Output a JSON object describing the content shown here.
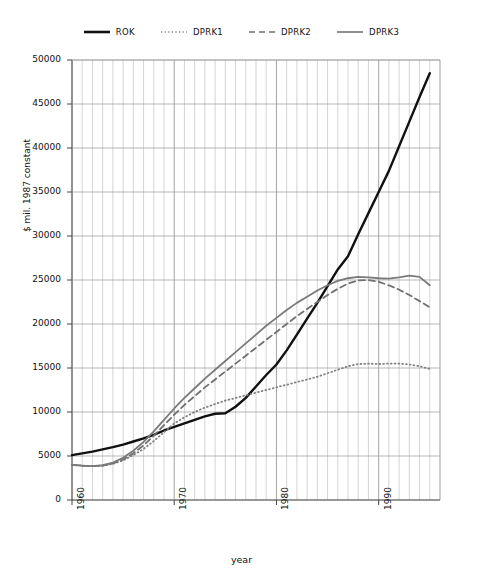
{
  "legend": {
    "items": [
      {
        "label": "ROK",
        "style": "solid-thick",
        "color": "#111111"
      },
      {
        "label": "DPRK1",
        "style": "dotted",
        "color": "#808080"
      },
      {
        "label": "DPRK2",
        "style": "dashed",
        "color": "#707070"
      },
      {
        "label": "DPRK3",
        "style": "solid",
        "color": "#7a7a7a"
      }
    ]
  },
  "chart_data": {
    "type": "line",
    "title": "",
    "xlabel": "year",
    "ylabel": "$ mil. 1987 constant",
    "xlim": [
      1960,
      1996
    ],
    "ylim": [
      0,
      50000
    ],
    "ytick_labels": [
      "0",
      "5000",
      "10000",
      "15000",
      "20000",
      "25000",
      "30000",
      "35000",
      "40000",
      "45000",
      "50000"
    ],
    "ytick_values": [
      0,
      5000,
      10000,
      15000,
      20000,
      25000,
      30000,
      35000,
      40000,
      45000,
      50000
    ],
    "xtick_labels": [
      "1960",
      "1970",
      "1980",
      "1990"
    ],
    "xtick_values": [
      1960,
      1970,
      1980,
      1990
    ],
    "grid": "both",
    "grid_minor_x": "every year",
    "legend_position": "top-center",
    "x": [
      1960,
      1961,
      1962,
      1963,
      1964,
      1965,
      1966,
      1967,
      1968,
      1969,
      1970,
      1971,
      1972,
      1973,
      1974,
      1975,
      1976,
      1977,
      1978,
      1979,
      1980,
      1981,
      1982,
      1983,
      1984,
      1985,
      1986,
      1987,
      1988,
      1989,
      1990,
      1991,
      1992,
      1993,
      1994,
      1995
    ],
    "series": [
      {
        "name": "ROK",
        "color": "#111111",
        "style": "solid-thick",
        "values": [
          5100,
          5300,
          5500,
          5750,
          6000,
          6300,
          6650,
          7000,
          7400,
          7900,
          8300,
          8700,
          9100,
          9500,
          9800,
          9850,
          10600,
          11600,
          12900,
          14200,
          15400,
          17000,
          18800,
          20600,
          22400,
          24300,
          26200,
          27700,
          30200,
          32600,
          35000,
          37400,
          40200,
          43000,
          45800,
          48500
        ]
      },
      {
        "name": "DPRK1",
        "color": "#808080",
        "style": "dotted",
        "values": [
          4000,
          3900,
          3850,
          3900,
          4100,
          4500,
          5100,
          5800,
          6700,
          7700,
          8700,
          9400,
          10000,
          10500,
          10900,
          11300,
          11600,
          11900,
          12200,
          12500,
          12800,
          13100,
          13400,
          13700,
          14000,
          14400,
          14800,
          15200,
          15450,
          15500,
          15450,
          15500,
          15500,
          15400,
          15200,
          14900
        ]
      },
      {
        "name": "DPRK2",
        "color": "#707070",
        "style": "dashed",
        "values": [
          4000,
          3900,
          3850,
          3900,
          4150,
          4600,
          5300,
          6200,
          7300,
          8500,
          9700,
          10800,
          11800,
          12800,
          13700,
          14600,
          15500,
          16400,
          17300,
          18200,
          19100,
          20000,
          20900,
          21700,
          22500,
          23300,
          24000,
          24600,
          24950,
          25000,
          24800,
          24400,
          23900,
          23300,
          22600,
          21900
        ]
      },
      {
        "name": "DPRK3",
        "color": "#7a7a7a",
        "style": "solid",
        "values": [
          4000,
          3900,
          3850,
          3950,
          4250,
          4800,
          5600,
          6600,
          7800,
          9100,
          10400,
          11600,
          12700,
          13800,
          14800,
          15800,
          16800,
          17800,
          18800,
          19800,
          20700,
          21600,
          22400,
          23100,
          23800,
          24400,
          24900,
          25200,
          25350,
          25300,
          25200,
          25150,
          25300,
          25500,
          25350,
          24400
        ]
      }
    ]
  }
}
